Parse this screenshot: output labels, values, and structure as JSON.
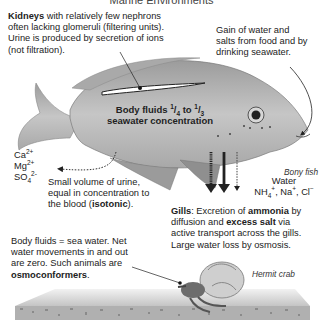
{
  "title": "Marine Environments",
  "kidneys": {
    "bold": "Kidneys",
    "line1_rest": " with relatively few nephrons",
    "line2": "often lacking glomeruli (filtering units).",
    "line3": "Urine is produced by secretion of ions",
    "line4": "(not filtration)."
  },
  "gain": {
    "line1": "Gain of water and",
    "line2": "salts from food and by",
    "line3": "drinking seawater."
  },
  "body_fluids": {
    "line1_a": "Body fluids ",
    "frac1_num": "1",
    "frac1_den": "4",
    "line1_b": " to ",
    "frac2_num": "1",
    "frac2_den": "3",
    "line2": "seawater concentration"
  },
  "ions": {
    "ca": "Ca",
    "ca_sup": "2+",
    "mg": "Mg",
    "mg_sup": "2+",
    "so": "SO",
    "so_sub": "4",
    "so_sup": "2-"
  },
  "urine": {
    "line1": "Small volume of urine,",
    "line2": "equal in concentration to",
    "line3_a": "the blood (",
    "line3_bold": "isotonic",
    "line3_b": ")."
  },
  "bony_fish_label": "Bony fish",
  "water_out": {
    "line1": "Water",
    "nh": "NH",
    "nh_sub": "4",
    "nh_sup": "+",
    "na": ", Na",
    "na_sup": "+",
    "cl": ", Cl",
    "cl_sup": "−"
  },
  "gills": {
    "bold1": "Gills",
    "t1": ": Excretion of ",
    "bold2": "ammonia",
    "t2": " by",
    "t3": "diffusion and ",
    "bold3": "excess salt",
    "t4": " via",
    "line3": "active transport across the gills.",
    "line4": "Large water loss by osmosis."
  },
  "crab_text": {
    "line1": "Body fluids = sea water. Net",
    "line2": "water movements in and out",
    "line3": "are zero. Such animals are",
    "bold": "osmoconformers",
    "end": "."
  },
  "hermit_crab_label": "Hermit crab",
  "colors": {
    "fish_body": "#b9b9b9",
    "fish_dark": "#8a8a8a",
    "seafloor": "#d4d4d4",
    "gravel": "#9a9a9a"
  }
}
